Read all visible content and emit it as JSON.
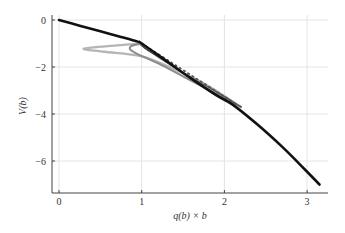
{
  "chart_data": {
    "type": "line",
    "title": "",
    "xlabel": "q(b) × b",
    "ylabel": "V(b)",
    "xlim": [
      -0.1,
      3.25
    ],
    "ylim": [
      -7.3,
      0.2
    ],
    "xticks": [
      0,
      1,
      2,
      3
    ],
    "xtick_labels": [
      "0",
      "1",
      "2",
      "3"
    ],
    "yticks": [
      0,
      -2,
      -4,
      -6
    ],
    "ytick_labels": [
      "0",
      "−2",
      "−4",
      "−6"
    ],
    "grid": true,
    "legend": null,
    "series": [
      {
        "name": "envelope",
        "color": "#111111",
        "width": 2.6,
        "style": "solid",
        "x": [
          0,
          0.25,
          0.5,
          0.75,
          0.95,
          1.0,
          1.3,
          1.6,
          1.9,
          2.1,
          2.4,
          2.7,
          2.9,
          3.15
        ],
        "y": [
          0,
          -0.24,
          -0.48,
          -0.72,
          -0.92,
          -1.0,
          -1.75,
          -2.5,
          -3.2,
          -3.6,
          -4.45,
          -5.4,
          -6.1,
          -7.0
        ]
      },
      {
        "name": "branch-light",
        "color": "#b5b5b5",
        "width": 2.4,
        "style": "solid",
        "x": [
          1.0,
          0.7,
          0.3,
          0.55,
          1.0,
          1.4,
          1.8,
          2.2
        ],
        "y": [
          -1.0,
          -1.08,
          -1.22,
          -1.35,
          -1.55,
          -2.1,
          -2.8,
          -3.7
        ]
      },
      {
        "name": "branch-medium",
        "color": "#8c8c8c",
        "width": 2.0,
        "style": "solid",
        "x": [
          1.0,
          0.88,
          0.86,
          0.95,
          1.2,
          1.5,
          1.8,
          2.2
        ],
        "y": [
          -1.0,
          -1.1,
          -1.25,
          -1.45,
          -1.85,
          -2.4,
          -2.95,
          -3.7
        ]
      },
      {
        "name": "branch-dark",
        "color": "#555555",
        "width": 1.4,
        "style": "solid",
        "x": [
          1.0,
          1.02,
          1.1,
          1.3,
          1.6,
          1.9,
          2.2
        ],
        "y": [
          -1.0,
          -1.15,
          -1.35,
          -1.8,
          -2.45,
          -3.05,
          -3.7
        ]
      },
      {
        "name": "tangent-dotted",
        "color": "#555555",
        "width": 1.8,
        "style": "dotted",
        "x": [
          1.0,
          2.15
        ],
        "y": [
          -1.0,
          -3.6
        ]
      }
    ]
  },
  "axes": {
    "x_label": "q(b) × b",
    "y_label": "V(b)",
    "x_tick_labels": [
      "0",
      "1",
      "2",
      "3"
    ],
    "y_tick_labels": [
      "0",
      "−2",
      "−4",
      "−6"
    ]
  }
}
